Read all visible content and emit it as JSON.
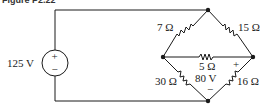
{
  "figure": {
    "label": "Figure P2.22"
  },
  "source": {
    "label": "125 V",
    "plus": "+",
    "minus": "−"
  },
  "resistors": {
    "r_top_left": "7 Ω",
    "r_top_right": "15 Ω",
    "r_middle": "5 Ω",
    "r_bottom_left": "30 Ω",
    "r_bottom_right": "16 Ω"
  },
  "dependent": {
    "label": "80 V",
    "plus": "+",
    "minus": "−"
  },
  "colors": {
    "wire": "#1a1a1a",
    "background": "#ffffff"
  }
}
